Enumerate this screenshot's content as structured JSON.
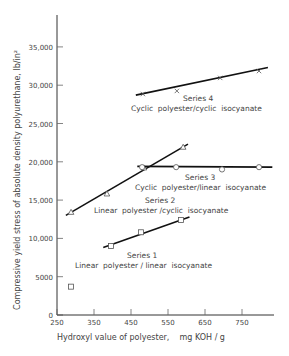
{
  "chart_data": {
    "type": "line",
    "title": "",
    "xlabel": "Hydroxyl value of polyester,    mg KOH / g",
    "ylabel": "Compressive  yield  stress  of  absolute  density  polyurethane,  lb/in²",
    "xlim": [
      250,
      800
    ],
    "ylim": [
      0,
      38000
    ],
    "xticks": [
      250,
      350,
      450,
      550,
      650,
      750
    ],
    "yticks": [
      0,
      5000,
      10000,
      15000,
      20000,
      25000,
      30000,
      35000
    ],
    "ytick_labels": [
      "0",
      "5000",
      "10,000",
      "15,000",
      "20,000",
      "25,000",
      "30,000",
      "35,000"
    ],
    "grid": false,
    "legend": "inline annotations",
    "series": [
      {
        "name": "Series 1",
        "description": "Linear polyester / linear isocyanate",
        "marker": "square",
        "points": [
          [
            396,
            9000
          ],
          [
            477,
            10800
          ],
          [
            585,
            12400
          ]
        ],
        "fit_line": [
          [
            375,
            8800
          ],
          [
            608,
            12800
          ]
        ],
        "outliers": [
          [
            288,
            3700
          ]
        ]
      },
      {
        "name": "Series 2",
        "description": "Linear polyester /cyclic isocyanate",
        "marker": "triangle",
        "points": [
          [
            288,
            13400
          ],
          [
            385,
            15800
          ],
          [
            485,
            19200
          ],
          [
            591,
            21900
          ]
        ],
        "fit_line": [
          [
            274,
            13000
          ],
          [
            604,
            22300
          ]
        ]
      },
      {
        "name": "Series 3",
        "description": "Cyclic polyester/linear isocyanate",
        "marker": "circle",
        "points": [
          [
            480,
            19300
          ],
          [
            572,
            19300
          ],
          [
            696,
            19000
          ],
          [
            796,
            19300
          ]
        ],
        "fit_line": [
          [
            467,
            19400
          ],
          [
            832,
            19300
          ]
        ]
      },
      {
        "name": "Series 4",
        "description": "Cyclic polyester/cyclic isocyanate",
        "marker": "cross",
        "points": [
          [
            482,
            28850
          ],
          [
            574,
            29250
          ],
          [
            691,
            30950
          ],
          [
            796,
            31850
          ]
        ],
        "fit_line": [
          [
            463,
            28700
          ],
          [
            820,
            32300
          ]
        ]
      }
    ]
  },
  "labels": {
    "series1_name": "Series 1",
    "series1_desc": "Linear  polyester / linear  isocyanate",
    "series2_name": "Series 2",
    "series2_desc": "Linear  polyester /cyclic  isocyanate",
    "series3_name": "Series 3",
    "series3_desc": "Cyclic  polyester/linear  isocyanate",
    "series4_name": "Series 4",
    "series4_desc": "Cyclic  polyester/cyclic  isocyanate"
  }
}
